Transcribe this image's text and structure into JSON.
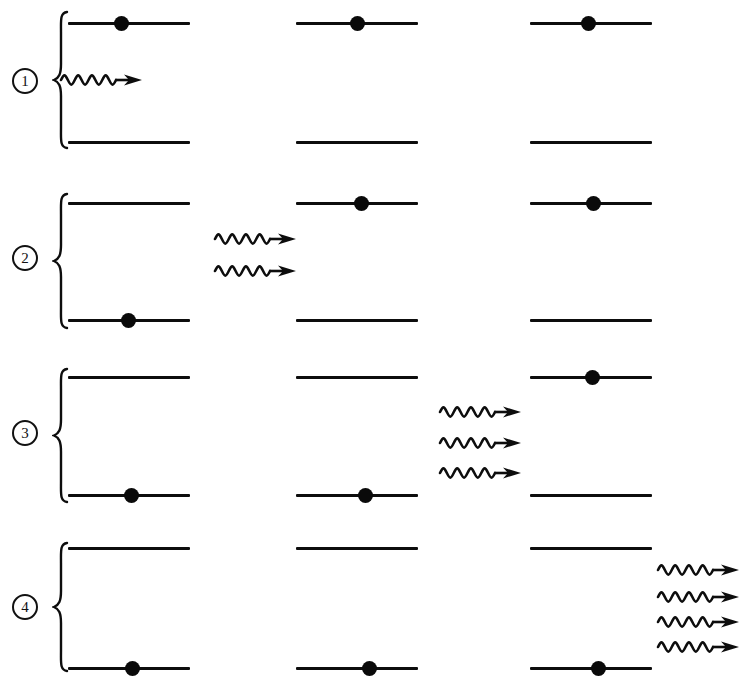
{
  "figure": {
    "type": "physics-energy-level-diagram",
    "background_color": "#ffffff",
    "ink_color": "#0d0d0d",
    "columns_per_row": 3,
    "levels_per_column": 2,
    "level_names": [
      "upper-level",
      "lower-level"
    ],
    "photon_glyph": "wavy-arrow-right",
    "electron_glyph": "filled-circle"
  },
  "rows": [
    {
      "id": "row-1",
      "badge": "1",
      "badge_label": "stage-1",
      "y_top": 0,
      "brace": {
        "x": 52,
        "y": 10,
        "height": 140
      },
      "badge_pos": {
        "x": 12,
        "y": 68
      },
      "upper_y": 22,
      "lower_y": 141,
      "columns": [
        {
          "id": "col-1",
          "x": 68,
          "width": 122,
          "electron_level": "upper",
          "electron_x": 114
        },
        {
          "id": "col-2",
          "x": 296,
          "width": 122,
          "electron_level": "upper",
          "electron_x": 350
        },
        {
          "id": "col-3",
          "x": 530,
          "width": 122,
          "electron_level": "upper",
          "electron_x": 581
        }
      ],
      "photon_group": {
        "count": 1,
        "x": 58,
        "ys": [
          80
        ],
        "label": "photon-group-row-1",
        "position_label": "before-column-1"
      }
    },
    {
      "id": "row-2",
      "badge": "2",
      "badge_label": "stage-2",
      "y_top": 175,
      "brace": {
        "x": 52,
        "y": 192,
        "height": 138
      },
      "badge_pos": {
        "x": 12,
        "y": 245
      },
      "upper_y": 202,
      "lower_y": 319,
      "columns": [
        {
          "id": "col-1",
          "x": 68,
          "width": 122,
          "electron_level": "lower",
          "electron_x": 121
        },
        {
          "id": "col-2",
          "x": 296,
          "width": 122,
          "electron_level": "upper",
          "electron_x": 354
        },
        {
          "id": "col-3",
          "x": 530,
          "width": 122,
          "electron_level": "upper",
          "electron_x": 586
        }
      ],
      "photon_group": {
        "count": 2,
        "x": 212,
        "ys": [
          239,
          271
        ],
        "label": "photon-group-row-2",
        "position_label": "between-column-1-and-2"
      }
    },
    {
      "id": "row-3",
      "badge": "3",
      "badge_label": "stage-3",
      "y_top": 350,
      "brace": {
        "x": 52,
        "y": 367,
        "height": 137
      },
      "badge_pos": {
        "x": 12,
        "y": 420
      },
      "upper_y": 376,
      "lower_y": 494,
      "columns": [
        {
          "id": "col-1",
          "x": 68,
          "width": 122,
          "electron_level": "lower",
          "electron_x": 124
        },
        {
          "id": "col-2",
          "x": 296,
          "width": 122,
          "electron_level": "lower",
          "electron_x": 358
        },
        {
          "id": "col-3",
          "x": 530,
          "width": 122,
          "electron_level": "upper",
          "electron_x": 585
        }
      ],
      "photon_group": {
        "count": 3,
        "x": 437,
        "ys": [
          412,
          443,
          473
        ],
        "label": "photon-group-row-3",
        "position_label": "between-column-2-and-3"
      }
    },
    {
      "id": "row-4",
      "badge": "4",
      "badge_label": "stage-4",
      "y_top": 520,
      "brace": {
        "x": 52,
        "y": 541,
        "height": 132
      },
      "badge_pos": {
        "x": 12,
        "y": 594
      },
      "upper_y": 547,
      "lower_y": 667,
      "columns": [
        {
          "id": "col-1",
          "x": 68,
          "width": 122,
          "electron_level": "lower",
          "electron_x": 125
        },
        {
          "id": "col-2",
          "x": 296,
          "width": 122,
          "electron_level": "lower",
          "electron_x": 362
        },
        {
          "id": "col-3",
          "x": 530,
          "width": 122,
          "electron_level": "lower",
          "electron_x": 591
        }
      ],
      "photon_group": {
        "count": 4,
        "x": 655,
        "ys": [
          570,
          597,
          622,
          647
        ],
        "label": "photon-group-row-4",
        "position_label": "after-column-3"
      }
    }
  ]
}
